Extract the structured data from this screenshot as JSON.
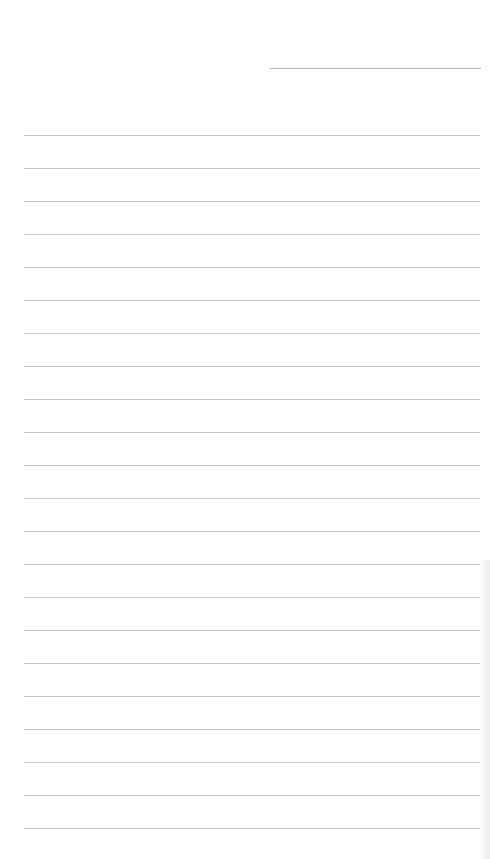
{
  "document": {
    "type": "lined-paper",
    "header_line": {
      "x": 270,
      "y": 68,
      "width": 211
    },
    "rules": {
      "count": 22,
      "first_y": 135,
      "spacing": 33,
      "left": 24,
      "width": 456
    },
    "colors": {
      "paper": "#ffffff",
      "rule": "#c4c4c4",
      "header_rule": "#b8b8b8"
    }
  }
}
